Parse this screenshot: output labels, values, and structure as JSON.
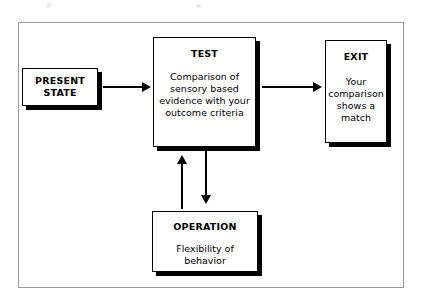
{
  "diagram": {
    "type": "flowchart",
    "background_color": "#ffffff",
    "frame_color": "#9a9a9a",
    "node_border_color": "#000000",
    "node_fill_color": "#ffffff",
    "shadow_color": "#000000",
    "nodes": [
      {
        "id": "present-state",
        "title": "PRESENT\nSTATE",
        "body": ""
      },
      {
        "id": "test",
        "title": "TEST",
        "body": "Comparison of\nsensory based\nevidence with your\noutcome criteria"
      },
      {
        "id": "exit",
        "title": "EXIT",
        "body": "Your\ncomparison\nshows a\nmatch"
      },
      {
        "id": "operation",
        "title": "OPERATION",
        "body": "Flexibility of\nbehavior"
      }
    ],
    "connectors": [
      {
        "id": "present-to-test",
        "from": "present-state",
        "to": "test",
        "direction": "right",
        "label": ""
      },
      {
        "id": "test-to-exit",
        "from": "test",
        "to": "exit",
        "direction": "right",
        "label": ""
      },
      {
        "id": "test-to-operation",
        "from": "test",
        "to": "operation",
        "direction": "down",
        "label": ""
      },
      {
        "id": "operation-to-test",
        "from": "operation",
        "to": "test",
        "direction": "up",
        "label": ""
      }
    ]
  }
}
